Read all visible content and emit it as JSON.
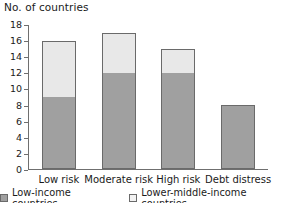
{
  "chart_data": {
    "type": "bar",
    "subtype": "stacked-vertical",
    "title": "No. of countries",
    "xlabel": "",
    "ylabel": "No. of countries",
    "ylim": [
      0,
      18
    ],
    "ytick_step": 2,
    "yticks": [
      0,
      2,
      4,
      6,
      8,
      10,
      12,
      14,
      16,
      18
    ],
    "ytick_labels": [
      "0",
      "2",
      "4",
      "6",
      "8",
      "10",
      "12",
      "14",
      "16",
      "18"
    ],
    "grid": false,
    "legend_position": "bottom-center",
    "categories": [
      "Low risk",
      "Moderate risk",
      "High risk",
      "Debt distress"
    ],
    "series": [
      {
        "name": "Low-income countries",
        "color": "#a0a0a0",
        "values": [
          9,
          12,
          12,
          8
        ]
      },
      {
        "name": "Lower-middle-income countries",
        "color": "#e8e8e8",
        "values": [
          7,
          5,
          3,
          0
        ]
      }
    ],
    "totals": [
      16,
      17,
      15,
      8
    ]
  },
  "axis": {
    "title": "No. of countries"
  },
  "legend": {
    "items": [
      {
        "label": "Low-income countries",
        "swatch": "dark-gray-swatch-icon"
      },
      {
        "label": "Lower-middle-income countries",
        "swatch": "light-gray-swatch-icon"
      }
    ]
  }
}
